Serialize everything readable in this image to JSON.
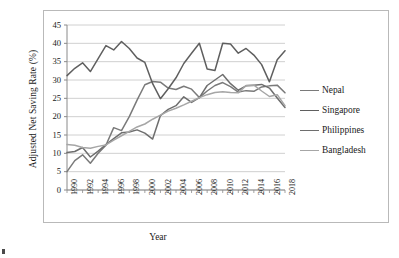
{
  "figure": {
    "title": "",
    "corner_mark": "page-artifact"
  },
  "axes": {
    "ylabel": "Adjusted Net Saving Rate (%)",
    "xlabel": "Year",
    "yticks": [
      "0",
      "5",
      "10",
      "15",
      "20",
      "25",
      "30",
      "35",
      "40",
      "45"
    ],
    "xticks": [
      "1990",
      "1992",
      "1994",
      "1996",
      "1998",
      "2000",
      "2002",
      "2004",
      "2006",
      "2008",
      "2010",
      "2012",
      "2014",
      "2016",
      "2018"
    ],
    "grid": "horizontal"
  },
  "legend": {
    "position": "right",
    "entries": [
      {
        "label": "Nepal",
        "color": "#7a7a7a"
      },
      {
        "label": "Singapore",
        "color": "#5f5f5f"
      },
      {
        "label": "Philippines",
        "color": "#6e6e6e"
      },
      {
        "label": "Bangladesh",
        "color": "#a6a6a6"
      }
    ]
  },
  "chart_data": {
    "type": "line",
    "title": "",
    "xlabel": "Year",
    "ylabel": "Adjusted Net Saving Rate (%)",
    "xlim": [
      1990,
      2018
    ],
    "ylim": [
      0,
      45
    ],
    "ytick_step": 5,
    "xtick_step": 2,
    "grid": true,
    "legend_position": "right",
    "x": [
      1990,
      1991,
      1992,
      1993,
      1994,
      1995,
      1996,
      1997,
      1998,
      1999,
      2000,
      2001,
      2002,
      2003,
      2004,
      2005,
      2006,
      2007,
      2008,
      2009,
      2010,
      2011,
      2012,
      2013,
      2014,
      2015,
      2016,
      2017,
      2018
    ],
    "series": [
      {
        "name": "Nepal",
        "color": "#7a7a7a",
        "values": [
          5.0,
          8.0,
          9.6,
          7.3,
          10.0,
          12.2,
          17.0,
          16.2,
          20.0,
          24.5,
          28.7,
          29.6,
          29.4,
          27.8,
          27.4,
          28.3,
          27.5,
          25.2,
          27.0,
          28.5,
          29.3,
          28.2,
          26.7,
          27.1,
          26.9,
          28.1,
          28.4,
          28.6,
          26.5
        ]
      },
      {
        "name": "Singapore",
        "color": "#5f5f5f",
        "values": [
          31.2,
          33.2,
          34.7,
          32.3,
          35.8,
          39.4,
          38.2,
          40.5,
          38.6,
          36.0,
          34.8,
          29.0,
          24.9,
          27.6,
          30.6,
          34.5,
          37.3,
          40.0,
          33.0,
          32.6,
          40.0,
          39.8,
          37.3,
          38.6,
          36.8,
          34.2,
          29.5,
          35.5,
          38.0
        ]
      },
      {
        "name": "Philippines",
        "color": "#6e6e6e",
        "values": [
          10.2,
          10.5,
          11.6,
          9.0,
          10.6,
          12.4,
          14.0,
          15.6,
          15.8,
          16.4,
          15.5,
          13.9,
          20.3,
          22.0,
          23.0,
          25.4,
          23.9,
          25.2,
          28.5,
          30.0,
          31.5,
          29.0,
          27.2,
          28.4,
          28.6,
          28.8,
          27.8,
          25.1,
          22.5
        ]
      },
      {
        "name": "Bangladesh",
        "color": "#a6a6a6",
        "values": [
          12.4,
          12.2,
          11.6,
          11.4,
          11.9,
          12.3,
          13.6,
          14.8,
          16.0,
          17.2,
          18.0,
          19.3,
          20.4,
          21.5,
          22.3,
          23.2,
          24.2,
          25.2,
          26.0,
          26.6,
          26.8,
          26.6,
          26.5,
          28.5,
          28.6,
          27.0,
          25.5,
          26.0,
          23.0
        ]
      }
    ]
  }
}
